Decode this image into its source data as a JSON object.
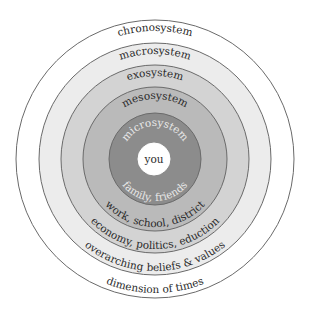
{
  "diagram": {
    "center": "you",
    "rings": [
      {
        "name": "chronosystem",
        "description": "dimension of times",
        "color": "#ffffff"
      },
      {
        "name": "macrosystem",
        "description": "overarching beliefs & values",
        "color": "#ececec"
      },
      {
        "name": "exosystem",
        "description": "economy, politics, eduction",
        "color": "#d3d3d3"
      },
      {
        "name": "mesosystem",
        "description": "work, school, district",
        "color": "#bababa"
      },
      {
        "name": "microsystem",
        "description": "family, friends",
        "color": "#8c8c8c"
      }
    ],
    "center_color": "#ffffff",
    "stroke_color": "#6a6a6a"
  }
}
